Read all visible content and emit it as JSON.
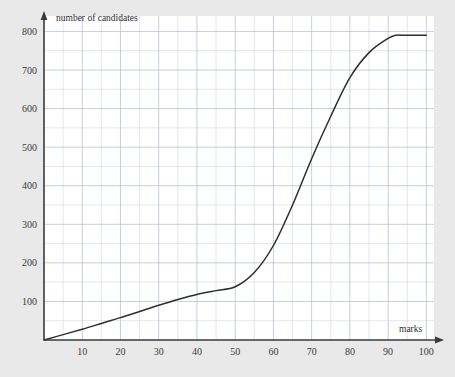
{
  "chart_data": {
    "type": "line",
    "title": "",
    "subtitle": "",
    "xlabel": "marks",
    "ylabel": "number of candidates",
    "xlim": [
      0,
      102
    ],
    "ylim": [
      0,
      840
    ],
    "grid": true,
    "grid_step_x": 5,
    "grid_step_y": 50,
    "legend": "none",
    "x_ticks": [
      10,
      20,
      30,
      40,
      50,
      60,
      70,
      80,
      90,
      100
    ],
    "x_tick_labels": [
      "10",
      "20",
      "30",
      "40",
      "50",
      "60",
      "70",
      "80",
      "90",
      "100"
    ],
    "y_ticks": [
      100,
      200,
      300,
      400,
      500,
      600,
      700,
      800
    ],
    "y_tick_labels": [
      "100",
      "200",
      "300",
      "400",
      "500",
      "600",
      "700",
      "800"
    ],
    "series": [
      {
        "name": "cumulative frequency",
        "color": "#2e2e2e",
        "x": [
          0,
          5,
          10,
          15,
          20,
          25,
          30,
          35,
          40,
          45,
          50,
          55,
          60,
          65,
          70,
          75,
          80,
          85,
          90,
          92,
          95,
          100
        ],
        "values": [
          0,
          14,
          28,
          43,
          58,
          74,
          90,
          105,
          118,
          128,
          138,
          175,
          245,
          350,
          470,
          580,
          680,
          745,
          782,
          790,
          790,
          790
        ]
      }
    ],
    "annotations": []
  },
  "axes": {
    "y_axis_caption": "number of candidates",
    "x_axis_caption": "marks"
  },
  "colors": {
    "page_background": "#e9e9e9",
    "plot_background": "#ffffff",
    "grid_minor": "#cfd6e4",
    "grid_major": "#b9c2d6",
    "axis": "#3a3a3a",
    "curve": "#2e2e2e",
    "tick_text": "#3a3a3a"
  }
}
